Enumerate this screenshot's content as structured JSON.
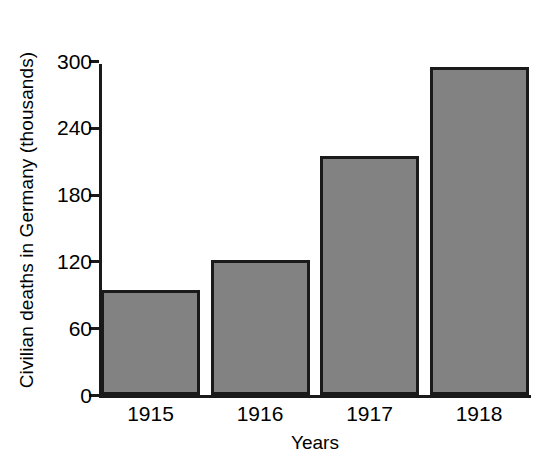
{
  "chart_data": {
    "type": "bar",
    "title": "",
    "xlabel": "Years",
    "ylabel": "Civilian deaths in Germany (thousands)",
    "categories": [
      "1915",
      "1916",
      "1917",
      "1918"
    ],
    "values": [
      94,
      121,
      215,
      295
    ],
    "ylim": [
      0,
      300
    ],
    "yticks": [
      0,
      60,
      120,
      180,
      240,
      300
    ],
    "ytick_labels": [
      "0",
      "60",
      "120",
      "180",
      "240",
      "300"
    ],
    "grid": false,
    "legend": null,
    "bar_color": "#828282",
    "bar_edge_color": "#1a1a1a",
    "background": "#ffffff",
    "axis_color": "#1a1a1a"
  }
}
